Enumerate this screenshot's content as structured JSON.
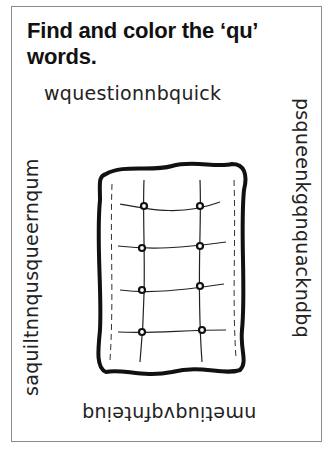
{
  "worksheet": {
    "title": "Find and color the ‘qu’ words.",
    "grid": {
      "top_row": "wquestionnbquick",
      "right_column": "psqueenkgqnquackndbq",
      "bottom_row": "nmetiuqvqfnteiuq",
      "left_column": "saquiltnnqusqueernqum"
    },
    "illustration": "quilt-icon"
  }
}
